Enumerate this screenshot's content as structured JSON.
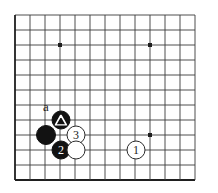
{
  "diagram": {
    "kind": "go-board-diagram",
    "board": {
      "origin_x": 15,
      "origin_y": 15,
      "spacing": 15,
      "cols": 13,
      "rows": 12,
      "line_color": "#3a3a3a",
      "border_color": "#1f1f1f",
      "background": "#ffffff",
      "star_points": [
        {
          "x": 60,
          "y": 45
        },
        {
          "x": 150,
          "y": 45
        },
        {
          "x": 150,
          "y": 135
        }
      ]
    },
    "labels": [
      {
        "text": "a",
        "x": 46,
        "y": 106,
        "name": "point-label-a"
      }
    ],
    "stones": [
      {
        "name": "black-stone-marked-triangle",
        "color": "black",
        "x": 61,
        "y": 120,
        "r": 9.5,
        "mark": "triangle",
        "number": ""
      },
      {
        "name": "black-stone-plain",
        "color": "black",
        "x": 46,
        "y": 135,
        "r": 10,
        "mark": "",
        "number": ""
      },
      {
        "name": "black-stone-2",
        "color": "black",
        "x": 61,
        "y": 150,
        "r": 9.5,
        "mark": "",
        "number": "2"
      },
      {
        "name": "white-stone-3",
        "color": "white",
        "x": 76,
        "y": 135,
        "r": 9.5,
        "mark": "",
        "number": "3"
      },
      {
        "name": "white-stone-plain",
        "color": "white",
        "x": 76,
        "y": 150,
        "r": 9.5,
        "mark": "",
        "number": ""
      },
      {
        "name": "white-stone-1",
        "color": "white",
        "x": 136,
        "y": 150,
        "r": 9.5,
        "mark": "",
        "number": "1"
      }
    ]
  }
}
